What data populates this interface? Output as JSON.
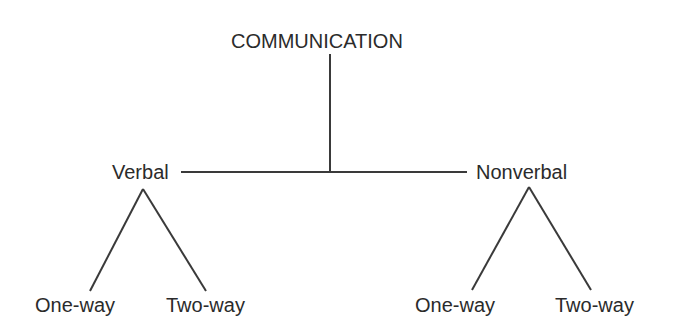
{
  "diagram": {
    "type": "tree",
    "root": {
      "label": "COMMUNICATION"
    },
    "branches": [
      {
        "label": "Verbal",
        "children": [
          {
            "label": "One-way"
          },
          {
            "label": "Two-way"
          }
        ]
      },
      {
        "label": "Nonverbal",
        "children": [
          {
            "label": "One-way"
          },
          {
            "label": "Two-way"
          }
        ]
      }
    ],
    "line_color": "#3a3a3a",
    "text_color": "#2b2b2b"
  }
}
